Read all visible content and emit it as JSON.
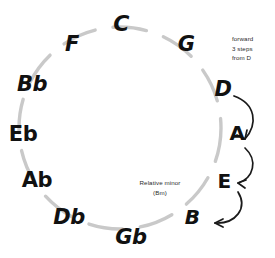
{
  "diagram": {
    "circle": {
      "center_x": 120,
      "center_y": 128,
      "radius": 101,
      "stroke_color": "#c9c9c9",
      "stroke_width": 3.4,
      "style": "dashed-gapped"
    },
    "note_color": "#111111",
    "arrow_color": "#1a1a1a",
    "notes": [
      {
        "label": "C",
        "angle": -90,
        "x": 121,
        "y": 24,
        "size": 22
      },
      {
        "label": "G",
        "angle": -60,
        "x": 186,
        "y": 44,
        "size": 21
      },
      {
        "label": "D",
        "angle": -30,
        "x": 223,
        "y": 89,
        "size": 21
      },
      {
        "label": "A",
        "angle": 0,
        "x": 237,
        "y": 133,
        "size": 20
      },
      {
        "label": "E",
        "angle": 30,
        "x": 224,
        "y": 181,
        "size": 20
      },
      {
        "label": "B",
        "angle": 60,
        "x": 192,
        "y": 217,
        "size": 20
      },
      {
        "label": "Gb",
        "angle": 90,
        "x": 131,
        "y": 237,
        "size": 21
      },
      {
        "label": "Db",
        "angle": 120,
        "x": 69,
        "y": 217,
        "size": 21
      },
      {
        "label": "Ab",
        "angle": 150,
        "x": 37,
        "y": 180,
        "size": 21
      },
      {
        "label": "Eb",
        "angle": 180,
        "x": 23,
        "y": 134,
        "size": 21
      },
      {
        "label": "Bb",
        "angle": 210,
        "x": 32,
        "y": 84,
        "size": 21
      },
      {
        "label": "F",
        "angle": 240,
        "x": 72,
        "y": 44,
        "size": 21
      }
    ],
    "annotations": [
      {
        "id": "forward-steps",
        "text": "forward\n3 steps\nfrom D",
        "x": 232,
        "y": 38,
        "align": "left"
      },
      {
        "id": "relative-minor",
        "text": "Relative minor\n(Bm)",
        "x": 160,
        "y": 181,
        "align": "center"
      }
    ],
    "arrows": [
      {
        "id": "arrow-d-to-a",
        "from": "D",
        "to": "A"
      },
      {
        "id": "arrow-a-to-e",
        "from": "A",
        "to": "E"
      },
      {
        "id": "arrow-e-to-b",
        "from": "E",
        "to": "B"
      }
    ]
  }
}
